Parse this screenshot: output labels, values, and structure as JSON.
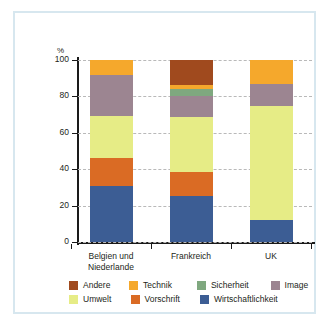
{
  "axis": {
    "unit_label": "%",
    "y_ticks": [
      "100",
      "80",
      "60",
      "40",
      "20",
      "0"
    ]
  },
  "legend": {
    "row1": [
      {
        "label": "Andere",
        "color": "#a04a1e"
      },
      {
        "label": "Technik",
        "color": "#f5a82c"
      },
      {
        "label": "Sicherheit",
        "color": "#7fa87f"
      },
      {
        "label": "Image",
        "color": "#9c8591"
      }
    ],
    "row2": [
      {
        "label": "Umwelt",
        "color": "#e6ec86"
      },
      {
        "label": "Vorschrift",
        "color": "#da6b24"
      },
      {
        "label": "Wirtschaftlichkeit",
        "color": "#3c5d94"
      }
    ]
  },
  "chart_data": {
    "type": "bar",
    "subtype": "stacked-bar-100",
    "title": "",
    "xlabel": "",
    "ylabel": "%",
    "ylim": [
      0,
      100
    ],
    "yticks": [
      0,
      20,
      40,
      60,
      80,
      100
    ],
    "grid": true,
    "legend_position": "bottom",
    "categories": [
      "Belgien und Niederlande",
      "Frankreich",
      "UK"
    ],
    "category_lines": [
      [
        "Belgien und",
        "Niederlande"
      ],
      [
        "Frankreich"
      ],
      [
        "UK"
      ]
    ],
    "series": [
      {
        "name": "Wirtschaftlichkeit",
        "color": "#3c5d94",
        "values": [
          30.5,
          25,
          12
        ]
      },
      {
        "name": "Vorschrift",
        "color": "#da6b24",
        "values": [
          15.5,
          13.5,
          0
        ]
      },
      {
        "name": "Umwelt",
        "color": "#e6ec86",
        "values": [
          23,
          30,
          62.5
        ]
      },
      {
        "name": "Image",
        "color": "#9c8591",
        "values": [
          23,
          11.5,
          12.5
        ]
      },
      {
        "name": "Sicherheit",
        "color": "#7fa87f",
        "values": [
          0,
          4,
          0
        ]
      },
      {
        "name": "Technik",
        "color": "#f5a82c",
        "values": [
          8,
          2,
          13
        ]
      },
      {
        "name": "Andere",
        "color": "#a04a1e",
        "values": [
          0,
          14,
          0
        ]
      }
    ]
  }
}
